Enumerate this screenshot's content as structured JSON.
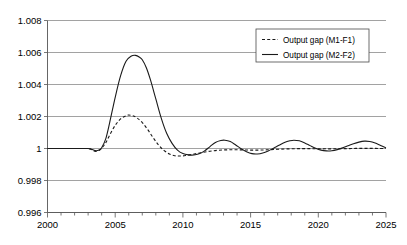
{
  "chart_data": {
    "type": "line",
    "title": "",
    "xlabel": "",
    "ylabel": "",
    "xlim": [
      2000,
      2025
    ],
    "ylim": [
      0.996,
      1.008
    ],
    "grid": true,
    "legend_position": "top-right",
    "x_ticks": [
      2000,
      2005,
      2010,
      2015,
      2020,
      2025
    ],
    "x_tick_labels": [
      "2000",
      "2005",
      "2010",
      "2015",
      "2020",
      "2025"
    ],
    "x_minor_tick_step": 1,
    "y_ticks": [
      0.996,
      0.998,
      1,
      1.002,
      1.004,
      1.006,
      1.008
    ],
    "y_tick_labels": [
      "0.996",
      "0.998",
      "1",
      "1.002",
      "1.004",
      "1.006",
      "1.008"
    ],
    "series": [
      {
        "name": "Output gap (M1-F1)",
        "style": "dashed",
        "color": "#1a1a1a",
        "x": [
          2000.0,
          2000.5,
          2001.0,
          2001.5,
          2002.0,
          2002.5,
          2003.0,
          2003.2,
          2003.4,
          2003.6,
          2003.8,
          2004.0,
          2004.3,
          2004.6,
          2005.0,
          2005.4,
          2005.8,
          2006.0,
          2006.3,
          2006.6,
          2007.0,
          2007.4,
          2007.8,
          2008.2,
          2008.6,
          2009.0,
          2009.4,
          2009.8,
          2010.2,
          2010.6,
          2011.0,
          2011.5,
          2012.0,
          2012.5,
          2013.0,
          2013.5,
          2014.0,
          2014.5,
          2015.0,
          2015.5,
          2016.0,
          2016.5,
          2017.0,
          2017.5,
          2018.0,
          2018.5,
          2019.0,
          2019.5,
          2020.0,
          2020.5,
          2021.0,
          2021.5,
          2022.0,
          2022.5,
          2023.0,
          2023.5,
          2024.0,
          2024.5,
          2025.0
        ],
        "y": [
          1.0,
          1.0,
          1.0,
          1.0,
          1.0,
          1.0,
          1.0,
          0.99995,
          0.99985,
          0.99982,
          0.99988,
          1.00002,
          1.00035,
          1.00085,
          1.00145,
          1.00185,
          1.00205,
          1.00209,
          1.00205,
          1.00192,
          1.00162,
          1.00118,
          1.00068,
          1.00022,
          0.99988,
          0.99966,
          0.99955,
          0.99953,
          0.99956,
          0.99962,
          0.99968,
          0.99976,
          0.99983,
          0.99988,
          0.99991,
          0.99992,
          0.99992,
          0.99991,
          0.9999,
          0.9999,
          0.99991,
          0.99993,
          0.99995,
          0.99997,
          0.99998,
          0.99999,
          0.99999,
          0.99999,
          0.99998,
          0.99998,
          0.99998,
          0.99999,
          0.99999,
          1.0,
          1.00001,
          1.00001,
          1.00001,
          1.0,
          1.0
        ]
      },
      {
        "name": "Output gap (M2-F2)",
        "style": "solid",
        "color": "#1a1a1a",
        "x": [
          2000.0,
          2000.5,
          2001.0,
          2001.5,
          2002.0,
          2002.5,
          2003.0,
          2003.2,
          2003.4,
          2003.6,
          2003.8,
          2004.0,
          2004.3,
          2004.6,
          2005.0,
          2005.4,
          2005.8,
          2006.2,
          2006.5,
          2006.8,
          2007.0,
          2007.3,
          2007.6,
          2008.0,
          2008.4,
          2008.8,
          2009.2,
          2009.6,
          2010.0,
          2010.4,
          2010.8,
          2011.2,
          2011.6,
          2012.0,
          2012.4,
          2012.8,
          2013.1,
          2013.5,
          2013.9,
          2014.3,
          2014.7,
          2015.1,
          2015.5,
          2015.9,
          2016.3,
          2016.7,
          2017.1,
          2017.5,
          2017.9,
          2018.2,
          2018.6,
          2019.0,
          2019.4,
          2019.8,
          2020.2,
          2020.6,
          2021.0,
          2021.4,
          2021.8,
          2022.2,
          2022.6,
          2023.0,
          2023.4,
          2023.8,
          2024.2,
          2024.6,
          2025.0
        ],
        "y": [
          1.0,
          1.0,
          1.0,
          1.0,
          1.0,
          1.0,
          1.0,
          0.99997,
          0.9999,
          0.99986,
          0.9999,
          1.00005,
          1.0006,
          1.00165,
          1.0032,
          1.00455,
          1.00545,
          1.00578,
          1.00582,
          1.0057,
          1.00555,
          1.00505,
          1.0043,
          1.0031,
          1.0019,
          1.00095,
          1.00032,
          0.9999,
          0.99968,
          0.9996,
          0.99959,
          0.99967,
          0.99985,
          1.00012,
          1.00038,
          1.0005,
          1.00052,
          1.00043,
          1.00022,
          0.99999,
          0.9998,
          0.99968,
          0.99966,
          0.99972,
          0.99985,
          1.00002,
          1.0002,
          1.00037,
          1.00048,
          1.00052,
          1.00048,
          1.00035,
          1.00018,
          1.00002,
          0.9999,
          0.99985,
          0.99986,
          0.99993,
          1.00004,
          1.00017,
          1.0003,
          1.0004,
          1.00046,
          1.00044,
          1.00034,
          1.00019,
          1.00005
        ]
      }
    ]
  },
  "legend": {
    "entries": [
      {
        "label": "Output gap (M1-F1)",
        "style": "dashed"
      },
      {
        "label": "Output gap (M2-F2)",
        "style": "solid"
      }
    ]
  }
}
